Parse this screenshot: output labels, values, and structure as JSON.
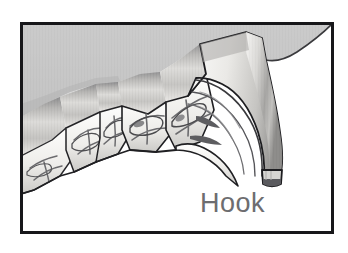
{
  "figure": {
    "name": "hook-dental-illustration",
    "title": "Hook",
    "style": "grayscale pencil / stipple medical illustration",
    "canvas": {
      "width": 348,
      "height": 253
    },
    "frame": {
      "name": "illustration-border",
      "x": 20,
      "y": 22,
      "width": 314,
      "height": 212,
      "stroke_color": "#17171a",
      "stroke_width": 3,
      "fill_color": "#ffffff",
      "page_background": "#ffffff"
    },
    "regions": [
      {
        "name": "gum-tissue",
        "label": "Gum / soft tissue background",
        "fill_color": "#c9c9c9",
        "edge_color": "#2a2a2d",
        "description": "gray shaded tissue filling the upper portion, bounded below by the tooth row and curving away at the upper right"
      },
      {
        "name": "tooth-row",
        "label": "Cheek teeth (molar arcade)",
        "fill_color": "#f4f3f1",
        "edge_color": "#232326",
        "count": 5,
        "description": "row of molars descending toward lower left, each with banded crown shading and occlusal surface detail"
      },
      {
        "name": "hook-tooth",
        "label": "Hook (overgrown tooth)",
        "fill_color": "#ebeae8",
        "edge_color": "#1d1d20",
        "tip_color": "#5a5a5e",
        "description": "large curved tooth at right, sweeping down and forward into a pointed hook with a dark flattened tip"
      }
    ],
    "caption": {
      "name": "hook-label",
      "text": "Hook",
      "x": 200,
      "y": 212,
      "font_size_px": 27,
      "color": "#6d6d70"
    },
    "palette": {
      "page_white": "#ffffff",
      "frame_black": "#17171a",
      "gum_gray": "#c9c9c9",
      "gum_shadow": "#a8a8a9",
      "tooth_white": "#f4f3f1",
      "tooth_shade": "#b9b8b6",
      "outline_dark": "#232326",
      "crevice_gray": "#6b6b6e",
      "caption_gray": "#6d6d70"
    }
  }
}
